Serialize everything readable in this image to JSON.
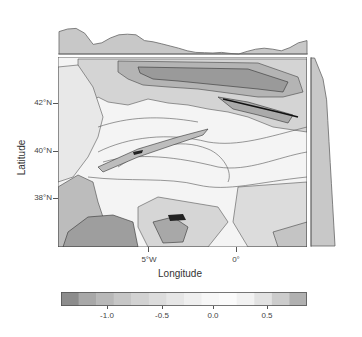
{
  "chart_data": {
    "type": "heatmap",
    "subtype": "filled contour map with marginal profiles",
    "title": "",
    "xlabel": "Longitude",
    "ylabel": "Latitude",
    "x_ticks": [
      "5°W",
      "0°"
    ],
    "y_ticks": [
      "42°N",
      "40°N",
      "38°N"
    ],
    "region": "Iberian Peninsula",
    "xlim": [
      -10,
      3.5
    ],
    "ylim": [
      36,
      44
    ],
    "colorbar": {
      "ticks": [
        "-1.0",
        "-0.5",
        "0.0",
        "0.5"
      ],
      "range": [
        -1.4,
        0.85
      ],
      "colors": [
        "#8c8c8c",
        "#a8a8a8",
        "#b8b8b8",
        "#c6c6c6",
        "#d2d2d2",
        "#dcdcdc",
        "#e6e6e6",
        "#efefef",
        "#f7f7f7",
        "#fbfbfb",
        "#f2f2f2",
        "#e2e2e2",
        "#cccccc",
        "#b0b0b0"
      ]
    },
    "top_profile": {
      "description": "zonal mean profile along longitude",
      "values": [
        0.7,
        0.78,
        0.8,
        0.65,
        0.3,
        0.35,
        0.5,
        0.6,
        0.62,
        0.6,
        0.42,
        0.38,
        0.32,
        0.25,
        0.18,
        0.1,
        0.05,
        0.04,
        0.03,
        0.05,
        0.02,
        0.0,
        0.08,
        0.15,
        0.18,
        0.15,
        0.1,
        0.2,
        0.35,
        0.42
      ]
    },
    "right_profile": {
      "description": "meridional mean profile along latitude",
      "values": [
        0.15,
        0.5,
        0.65,
        0.7,
        0.75,
        0.8,
        0.85,
        0.9,
        0.95,
        1.0
      ]
    },
    "grid": false,
    "legend_position": "bottom"
  },
  "axes": {
    "xlabel": "Longitude",
    "ylabel": "Latitude",
    "x_ticks": [
      {
        "label": "5°W"
      },
      {
        "label": "0°"
      }
    ],
    "y_ticks": [
      {
        "label": "42°N"
      },
      {
        "label": "40°N"
      },
      {
        "label": "38°N"
      }
    ]
  },
  "colorbar": {
    "ticks": [
      {
        "label": "-1.0"
      },
      {
        "label": "-0.5"
      },
      {
        "label": "0.0"
      },
      {
        "label": "0.5"
      }
    ]
  }
}
